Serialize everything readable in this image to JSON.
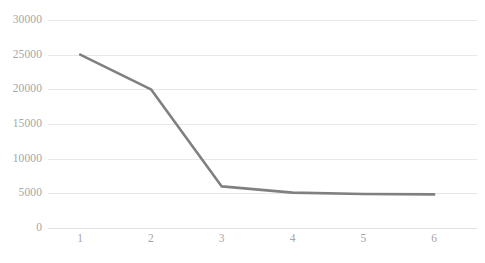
{
  "chart_data": {
    "type": "line",
    "title": "",
    "subtitle": "",
    "xlabel": "",
    "ylabel": "",
    "categories": [
      "1",
      "2",
      "3",
      "4",
      "5",
      "6"
    ],
    "x": [
      1,
      2,
      3,
      4,
      5,
      6
    ],
    "values": [
      25000,
      20000,
      6000,
      5100,
      4900,
      4850
    ],
    "series": [
      {
        "name": "",
        "values": [
          25000,
          20000,
          6000,
          5100,
          4900,
          4850
        ]
      }
    ],
    "ylim": [
      0,
      30000
    ],
    "xlim": [
      1,
      6
    ],
    "ytick_labels": [
      "30000",
      "25000",
      "20000",
      "15000",
      "10000",
      "5000",
      "0"
    ],
    "ytick_values": [
      30000,
      25000,
      20000,
      15000,
      10000,
      5000,
      0
    ],
    "xtick_labels": [
      "1",
      "2",
      "3",
      "4",
      "5",
      "6"
    ],
    "grid": true,
    "grid_axis": "y",
    "legend": false,
    "legend_position": "none",
    "annotations": [],
    "markers": false
  },
  "style": {
    "line_color": "#808080",
    "grid_color": "#e8e8e8",
    "tick_label_color": "#a6a6a6",
    "background": "#ffffff",
    "line_width": 2.6
  }
}
